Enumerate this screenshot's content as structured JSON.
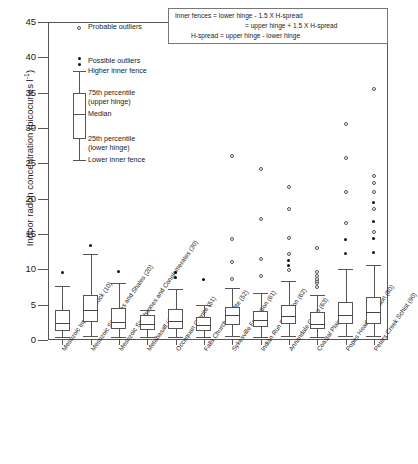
{
  "chart_data": {
    "type": "box",
    "title": "",
    "xlabel": "",
    "ylabel": "Indoor radon concentration (picocuries l",
    "ylabel_exponent": "-1",
    "ylabel_close": ")",
    "ylim": [
      0,
      45
    ],
    "yticks": [
      0,
      5,
      10,
      15,
      20,
      25,
      30,
      35,
      40,
      45
    ],
    "grid": false,
    "categories": [
      "Mesozoic Intrusive Rock (10)",
      "Mesozoic Siltstones and Shales (20)",
      "Mesozoic Sandstones and Conglomerates (30)",
      "Metabasalt (40)",
      "Occoquan Granite (51)",
      "Falls Church Tonalite (52)",
      "Sykesville Formation (61)",
      "Indian Run Formation (62)",
      "Annandale Group (63)",
      "Coastal Plain (70)",
      "Popes Head Formation (80)",
      "Peters Creek Schist (90)"
    ],
    "boxes": [
      {
        "category": "Mesozoic Intrusive Rock (10)",
        "lower_fence": 0.4,
        "q1": 1.3,
        "median": 2.4,
        "q3": 4.2,
        "upper_fence": 7.7,
        "probable_outliers": [],
        "possible_outliers": [
          9.6
        ]
      },
      {
        "category": "Mesozoic Siltstones and Shales (20)",
        "lower_fence": 0.5,
        "q1": 2.6,
        "median": 4.3,
        "q3": 6.4,
        "upper_fence": 12.2,
        "probable_outliers": [],
        "possible_outliers": [
          13.4
        ]
      },
      {
        "category": "Mesozoic Sandstones and Conglomerates (30)",
        "lower_fence": 0.4,
        "q1": 1.5,
        "median": 2.6,
        "q3": 4.5,
        "upper_fence": 8.0,
        "probable_outliers": [],
        "possible_outliers": [
          9.7
        ]
      },
      {
        "category": "Metabasalt (40)",
        "lower_fence": 0.4,
        "q1": 1.4,
        "median": 2.2,
        "q3": 3.5,
        "upper_fence": 4.3,
        "probable_outliers": [],
        "possible_outliers": []
      },
      {
        "category": "Occoquan Granite (51)",
        "lower_fence": 0.4,
        "q1": 1.6,
        "median": 2.7,
        "q3": 4.4,
        "upper_fence": 7.2,
        "probable_outliers": [],
        "possible_outliers": [
          8.8,
          9.6
        ]
      },
      {
        "category": "Falls Church Tonalite (52)",
        "lower_fence": 0.4,
        "q1": 1.3,
        "median": 2.1,
        "q3": 3.2,
        "upper_fence": 5.0,
        "probable_outliers": [],
        "possible_outliers": [
          8.5
        ]
      },
      {
        "category": "Sykesville Formation (61)",
        "lower_fence": 0.5,
        "q1": 2.1,
        "median": 3.5,
        "q3": 4.6,
        "upper_fence": 7.4,
        "probable_outliers": [
          8.6,
          11.0,
          14.3,
          26.1
        ],
        "possible_outliers": []
      },
      {
        "category": "Indian Run Formation (62)",
        "lower_fence": 0.4,
        "q1": 1.8,
        "median": 2.9,
        "q3": 4.1,
        "upper_fence": 6.6,
        "probable_outliers": [
          9.1,
          11.4,
          17.1,
          24.2
        ],
        "possible_outliers": []
      },
      {
        "category": "Annandale Group (63)",
        "lower_fence": 0.5,
        "q1": 2.2,
        "median": 3.4,
        "q3": 4.9,
        "upper_fence": 8.3,
        "probable_outliers": [
          9.9,
          12.2,
          14.5,
          18.6,
          21.6
        ],
        "possible_outliers": [
          10.5,
          11.2
        ]
      },
      {
        "category": "Coastal Plain (70)",
        "lower_fence": 0.4,
        "q1": 1.5,
        "median": 2.2,
        "q3": 3.9,
        "upper_fence": 6.3,
        "probable_outliers": [
          7.5,
          8.0,
          8.3,
          8.7,
          9.1,
          9.6,
          13.0
        ],
        "possible_outliers": []
      },
      {
        "category": "Popes Head Formation (80)",
        "lower_fence": 0.5,
        "q1": 2.3,
        "median": 3.6,
        "q3": 5.4,
        "upper_fence": 10.1,
        "probable_outliers": [
          16.6,
          20.9,
          25.7,
          30.6
        ],
        "possible_outliers": [
          12.2,
          14.2
        ]
      },
      {
        "category": "Peters Creek Schist (90)",
        "lower_fence": 0.5,
        "q1": 2.3,
        "median": 3.9,
        "q3": 6.1,
        "upper_fence": 10.6,
        "probable_outliers": [
          15.3,
          18.6,
          21.0,
          22.2,
          23.2,
          35.5
        ],
        "possible_outliers": [
          12.4,
          14.4,
          16.7,
          19.5
        ]
      }
    ],
    "legend_key": {
      "probable_outliers": "Probable outliers",
      "possible_outliers": "Possible outliers",
      "higher_inner_fence": "Higher inner fence",
      "upper_hinge_1": "75th percentile",
      "upper_hinge_2": "(upper hinge)",
      "median": "Median",
      "lower_hinge_1": "25th percentile",
      "lower_hinge_2": "(lower hinge)",
      "lower_inner_fence": "Lower inner  fence"
    },
    "fence_note": {
      "line1": "Inner fences = lower hinge - 1.5 X H-spread",
      "line2": "= upper hinge + 1.5 X H-spread",
      "line3": "H-spread = upper hinge - lower hinge"
    }
  }
}
